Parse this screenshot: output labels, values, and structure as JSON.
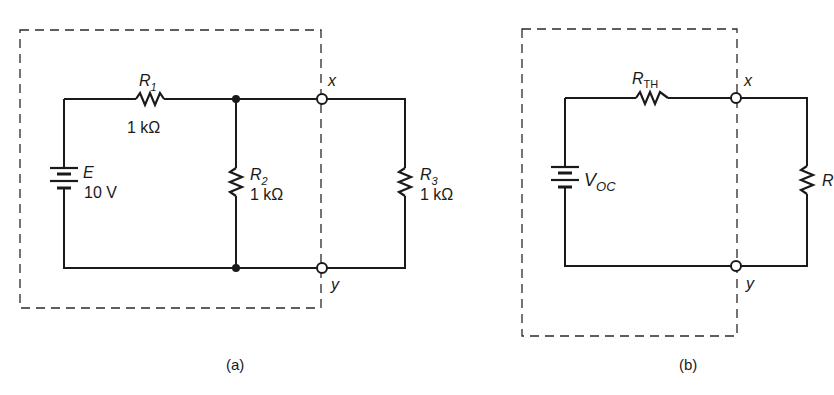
{
  "figure": {
    "panels": [
      {
        "id": "a",
        "caption": "(a)",
        "source": {
          "symbol": "E",
          "value": "10 V"
        },
        "resistors": [
          {
            "name": "R",
            "sub": "1",
            "value": "1 kΩ"
          },
          {
            "name": "R",
            "sub": "2",
            "value": "1 kΩ"
          },
          {
            "name": "R",
            "sub": "3",
            "value": "1 kΩ"
          }
        ],
        "terminals": {
          "top": "x",
          "bottom": "y"
        }
      },
      {
        "id": "b",
        "caption": "(b)",
        "source": {
          "symbol": "V",
          "sub": "OC"
        },
        "resistors": [
          {
            "name": "R",
            "sub": "TH"
          },
          {
            "name": "R"
          }
        ],
        "terminals": {
          "top": "x",
          "bottom": "y"
        }
      }
    ],
    "colors": {
      "ink": "#1a1a1a",
      "background": "#ffffff"
    }
  }
}
